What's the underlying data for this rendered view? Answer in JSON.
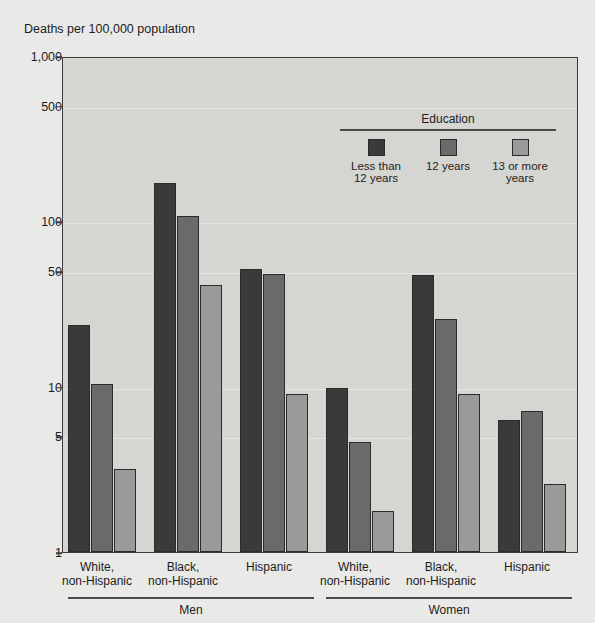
{
  "chart_data": {
    "type": "bar",
    "title": "",
    "ylabel": "Deaths per 100,000 population",
    "xlabel": "",
    "yscale": "log",
    "ylim": [
      1,
      1000
    ],
    "yticks": [
      1,
      5,
      10,
      50,
      100,
      500,
      1000
    ],
    "ytick_labels": [
      "1",
      "5",
      "10",
      "50",
      "100",
      "500",
      "1,000"
    ],
    "grid": true,
    "legend": {
      "title": "Education",
      "position": "upper right inside",
      "entries": [
        {
          "label": "Less than\n12 years",
          "line1": "Less than",
          "line2": "12 years",
          "color": "#3a3a3a"
        },
        {
          "label": "12 years",
          "line1": "12 years",
          "line2": "",
          "color": "#6a6a6a"
        },
        {
          "label": "13 or more\nyears",
          "line1": "13 or more",
          "line2": "years",
          "color": "#9a9a9a"
        }
      ]
    },
    "series": [
      {
        "name": "Less than 12 years",
        "color": "#3a3a3a",
        "values": [
          24,
          173,
          52,
          10,
          48,
          6.4
        ]
      },
      {
        "name": "12 years",
        "color": "#6a6a6a",
        "values": [
          10.5,
          110,
          49,
          4.7,
          26,
          7.2
        ]
      },
      {
        "name": "13 or more years",
        "color": "#9a9a9a",
        "values": [
          3.2,
          42,
          9.1,
          1.8,
          9.2,
          2.6
        ]
      }
    ],
    "categories": [
      "White, non-Hispanic",
      "Black, non-Hispanic",
      "Hispanic",
      "White, non-Hispanic",
      "Black, non-Hispanic",
      "Hispanic"
    ],
    "category_lines": [
      {
        "line1": "White,",
        "line2": "non-Hispanic"
      },
      {
        "line1": "Black,",
        "line2": "non-Hispanic"
      },
      {
        "line1": "Hispanic",
        "line2": ""
      },
      {
        "line1": "White,",
        "line2": "non-Hispanic"
      },
      {
        "line1": "Black,",
        "line2": "non-Hispanic"
      },
      {
        "line1": "Hispanic",
        "line2": ""
      }
    ],
    "supergroups": [
      {
        "label": "Men",
        "categories": [
          0,
          1,
          2
        ]
      },
      {
        "label": "Women",
        "categories": [
          3,
          4,
          5
        ]
      }
    ],
    "colors": {
      "plot_background": "#d5d5d2",
      "figure_background": "#e9e9e7",
      "axis": "#3c3c3c",
      "gridline": "#e4e4e1"
    }
  }
}
